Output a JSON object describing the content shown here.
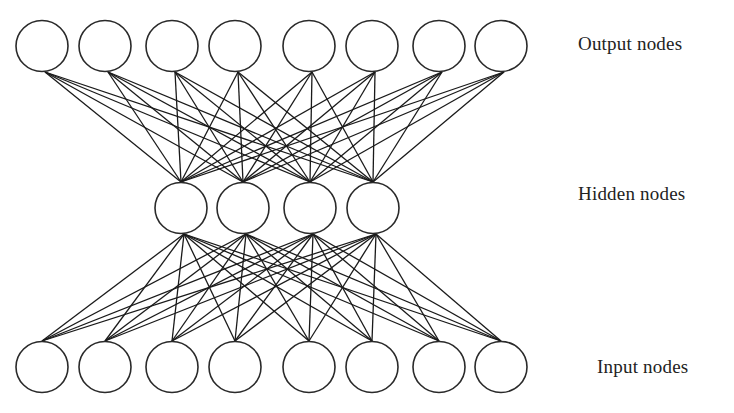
{
  "diagram": {
    "type": "autoencoder-neural-network",
    "node_radius": 26,
    "colors": {
      "background": "#ffffff",
      "node_stroke": "#2a2a2a",
      "node_fill": "#ffffff",
      "edge": "#1a1a1a",
      "label": "#222222"
    },
    "layers": [
      {
        "id": "output",
        "label": "Output nodes",
        "center_y": 46,
        "node_x": [
          42,
          105,
          172,
          235,
          309,
          372,
          439,
          501
        ],
        "label_x": 578,
        "label_y": 46
      },
      {
        "id": "hidden",
        "label": "Hidden nodes",
        "center_y": 208,
        "node_x": [
          181,
          243,
          310,
          373
        ],
        "label_x": 578,
        "label_y": 196
      },
      {
        "id": "input",
        "label": "Input nodes",
        "center_y": 367,
        "node_x": [
          42,
          105,
          172,
          235,
          309,
          372,
          439,
          501
        ],
        "label_x": 597,
        "label_y": 369
      }
    ],
    "connections": [
      {
        "from": "output",
        "to": "hidden",
        "fully_connected": true
      },
      {
        "from": "hidden",
        "to": "input",
        "fully_connected": true
      }
    ]
  }
}
